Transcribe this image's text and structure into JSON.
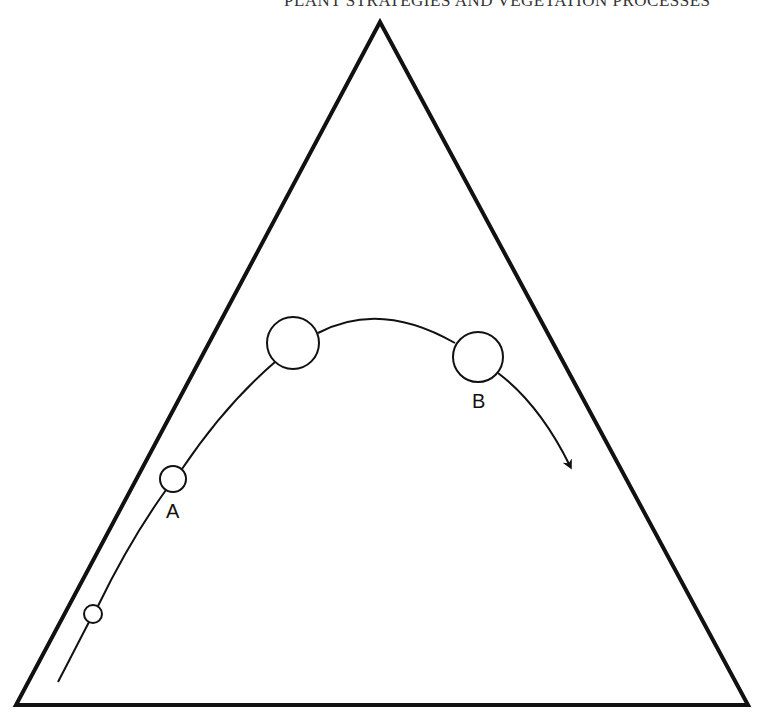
{
  "header": {
    "running_head": "PLANT STRATEGIES AND VEGETATION PROCESSES"
  },
  "diagram": {
    "type": "triangular ordination with trajectory",
    "triangle": {
      "vertices": [
        [
          380,
          22
        ],
        [
          16,
          705
        ],
        [
          748,
          705
        ]
      ],
      "stroke": "#111111"
    },
    "trajectory": {
      "start": [
        58,
        682
      ],
      "end_arrow": [
        572,
        470
      ],
      "stroke": "#111111"
    },
    "nodes": [
      {
        "id": "n1",
        "cx": 93,
        "cy": 614,
        "r": 9,
        "label": ""
      },
      {
        "id": "A",
        "cx": 173,
        "cy": 479,
        "r": 13,
        "label": "A"
      },
      {
        "id": "n3",
        "cx": 293,
        "cy": 343,
        "r": 26,
        "label": ""
      },
      {
        "id": "B",
        "cx": 478,
        "cy": 357,
        "r": 25,
        "label": "B"
      }
    ],
    "labels": {
      "a": "A",
      "b": "B"
    }
  }
}
